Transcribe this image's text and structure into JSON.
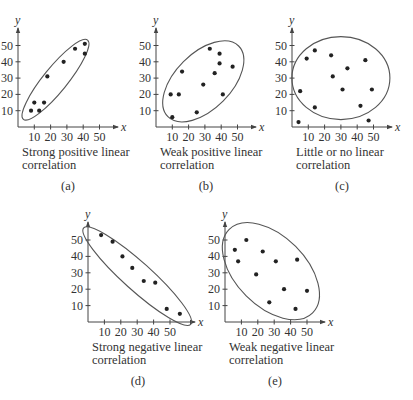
{
  "chart_data": [
    {
      "id": "a",
      "type": "scatter",
      "panel_label": "(a)",
      "caption": [
        "Strong positive linear",
        "correlation"
      ],
      "xlabel": "x",
      "ylabel": "y",
      "xticks": [
        10,
        20,
        30,
        40,
        50
      ],
      "yticks": [
        10,
        20,
        30,
        40,
        50
      ],
      "xlim": [
        0,
        60
      ],
      "ylim": [
        0,
        60
      ],
      "grid": false,
      "points": [
        [
          8,
          10
        ],
        [
          13,
          10
        ],
        [
          10,
          15
        ],
        [
          16,
          15
        ],
        [
          18,
          31
        ],
        [
          28,
          40
        ],
        [
          35,
          48
        ],
        [
          41,
          51
        ],
        [
          41,
          45
        ]
      ],
      "ellipse": {
        "cx": 23,
        "cy": 29,
        "rx_px": 51,
        "ry_px": 12,
        "angle_deg": -51
      },
      "layout": {
        "ox": 18,
        "oy": 127,
        "scale": 1.63,
        "xaxis_end": 118,
        "yaxis_top": 28
      }
    },
    {
      "id": "b",
      "type": "scatter",
      "panel_label": "(b)",
      "caption": [
        "Weak positive linear",
        "correlation"
      ],
      "xlabel": "x",
      "ylabel": "y",
      "xticks": [
        10,
        20,
        30,
        40,
        50
      ],
      "yticks": [
        10,
        20,
        30,
        40,
        50
      ],
      "xlim": [
        0,
        60
      ],
      "ylim": [
        0,
        60
      ],
      "grid": false,
      "points": [
        [
          9,
          20
        ],
        [
          14,
          20
        ],
        [
          16,
          34
        ],
        [
          10,
          6
        ],
        [
          25,
          9
        ],
        [
          29,
          26
        ],
        [
          33,
          48
        ],
        [
          36,
          33
        ],
        [
          39,
          45
        ],
        [
          39,
          39
        ],
        [
          41,
          20
        ],
        [
          47,
          37
        ]
      ],
      "ellipse": {
        "cx": 29,
        "cy": 28,
        "rx_px": 50,
        "ry_px": 28,
        "angle_deg": -45
      },
      "layout": {
        "ox": 156,
        "oy": 127,
        "scale": 1.63,
        "xaxis_end": 256,
        "yaxis_top": 28
      }
    },
    {
      "id": "c",
      "type": "scatter",
      "panel_label": "(c)",
      "caption": [
        "Little or no linear",
        "correlation"
      ],
      "xlabel": "x",
      "ylabel": "y",
      "xticks": [
        10,
        20,
        30,
        40,
        50
      ],
      "yticks": [
        10,
        20,
        30,
        40,
        50
      ],
      "xlim": [
        0,
        60
      ],
      "ylim": [
        0,
        60
      ],
      "grid": false,
      "points": [
        [
          4,
          3
        ],
        [
          5,
          22
        ],
        [
          9,
          42
        ],
        [
          14,
          47
        ],
        [
          14,
          12
        ],
        [
          24,
          44
        ],
        [
          25,
          31
        ],
        [
          31,
          23
        ],
        [
          34,
          36
        ],
        [
          42,
          13
        ],
        [
          45,
          41
        ],
        [
          47,
          4
        ],
        [
          49,
          23
        ]
      ],
      "ellipse": {
        "cx": 30,
        "cy": 30,
        "rx_px": 49,
        "ry_px": 41.5,
        "angle_deg": 0
      },
      "layout": {
        "ox": 292,
        "oy": 127,
        "scale": 1.63,
        "xaxis_end": 392,
        "yaxis_top": 28
      }
    },
    {
      "id": "d",
      "type": "scatter",
      "panel_label": "(d)",
      "caption": [
        "Strong negative linear",
        "correlation"
      ],
      "xlabel": "x",
      "ylabel": "y",
      "xticks": [
        10,
        20,
        30,
        40,
        50
      ],
      "yticks": [
        10,
        20,
        30,
        40,
        50
      ],
      "xlim": [
        0,
        60
      ],
      "ylim": [
        0,
        60
      ],
      "grid": false,
      "points": [
        [
          8,
          53
        ],
        [
          15,
          49
        ],
        [
          21,
          40
        ],
        [
          27,
          33
        ],
        [
          34,
          25
        ],
        [
          41,
          24
        ],
        [
          48,
          8
        ],
        [
          56,
          5
        ]
      ],
      "ellipse": {
        "cx": 30,
        "cy": 28,
        "rx_px": 72,
        "ry_px": 14,
        "angle_deg": 42
      },
      "layout": {
        "ox": 88,
        "oy": 322,
        "scale": 1.64,
        "xaxis_end": 195,
        "yaxis_top": 222
      }
    },
    {
      "id": "e",
      "type": "scatter",
      "panel_label": "(e)",
      "caption": [
        "Weak negative linear",
        "correlation"
      ],
      "xlabel": "x",
      "ylabel": "y",
      "xticks": [
        10,
        20,
        30,
        40,
        50
      ],
      "yticks": [
        10,
        20,
        30,
        40,
        50
      ],
      "xlim": [
        0,
        60
      ],
      "ylim": [
        0,
        60
      ],
      "grid": false,
      "points": [
        [
          6,
          44
        ],
        [
          8,
          37
        ],
        [
          13,
          50
        ],
        [
          19,
          29
        ],
        [
          23,
          43
        ],
        [
          27,
          12
        ],
        [
          31,
          37
        ],
        [
          36,
          20
        ],
        [
          43,
          8
        ],
        [
          44,
          38
        ],
        [
          50,
          19
        ]
      ],
      "ellipse": {
        "cx": 28,
        "cy": 31,
        "rx_px": 59,
        "ry_px": 35,
        "angle_deg": 45
      },
      "layout": {
        "ox": 225,
        "oy": 322,
        "scale": 1.64,
        "xaxis_end": 325,
        "yaxis_top": 222
      }
    }
  ]
}
